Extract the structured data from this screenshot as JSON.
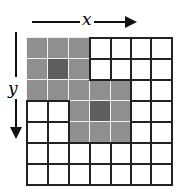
{
  "diagram": {
    "title": "",
    "axes": {
      "x_label": "x",
      "y_label": "y"
    },
    "grid": {
      "rows": 7,
      "cols": 7,
      "cell_size": 21,
      "line_color": "#222222",
      "shaded_color": "#8f8f8f",
      "dark_color": "#5e5e5e",
      "empty_color": "#ffffff"
    },
    "shaded_cells": [
      {
        "row": 0,
        "col": 0,
        "shade": "light"
      },
      {
        "row": 0,
        "col": 1,
        "shade": "light"
      },
      {
        "row": 0,
        "col": 2,
        "shade": "light"
      },
      {
        "row": 1,
        "col": 0,
        "shade": "light"
      },
      {
        "row": 1,
        "col": 1,
        "shade": "dark"
      },
      {
        "row": 1,
        "col": 2,
        "shade": "light"
      },
      {
        "row": 2,
        "col": 0,
        "shade": "light"
      },
      {
        "row": 2,
        "col": 1,
        "shade": "light"
      },
      {
        "row": 2,
        "col": 2,
        "shade": "light"
      },
      {
        "row": 2,
        "col": 3,
        "shade": "light"
      },
      {
        "row": 2,
        "col": 4,
        "shade": "light"
      },
      {
        "row": 3,
        "col": 2,
        "shade": "light"
      },
      {
        "row": 3,
        "col": 3,
        "shade": "dark"
      },
      {
        "row": 3,
        "col": 4,
        "shade": "light"
      },
      {
        "row": 4,
        "col": 2,
        "shade": "light"
      },
      {
        "row": 4,
        "col": 3,
        "shade": "light"
      },
      {
        "row": 4,
        "col": 4,
        "shade": "light"
      }
    ]
  }
}
